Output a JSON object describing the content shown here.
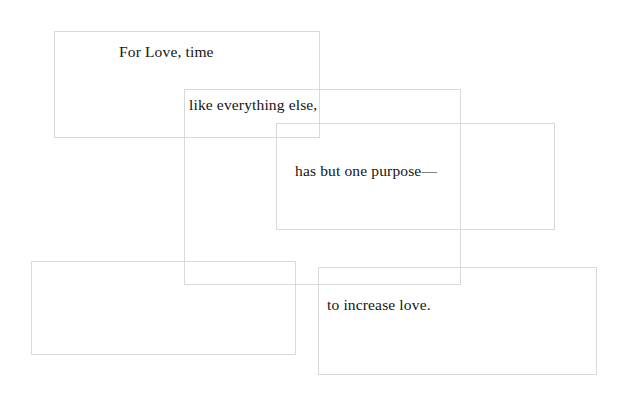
{
  "page": {
    "background_color": "#ffffff",
    "text_color": "#141414",
    "border_color": "#d9d9d9",
    "width": 627,
    "height": 405
  },
  "poem": {
    "lines": [
      "For Love, time",
      "like everything else,",
      "has but one purpose—",
      "to increase love."
    ],
    "full_text": "For Love, time like everything else, has but one purpose— to increase love."
  },
  "boxes": [
    {
      "id": "box-1",
      "label": "For Love, time",
      "x": 54,
      "y": 31,
      "width": 266,
      "height": 107,
      "text": "For Love, time",
      "text_x": 119,
      "text_y": 44,
      "empty": false
    },
    {
      "id": "box-2",
      "label": "like everything else,",
      "x": 184,
      "y": 89,
      "width": 277,
      "height": 196,
      "text": "like everything else,",
      "text_x": 189,
      "text_y": 97,
      "empty": false
    },
    {
      "id": "box-3",
      "label": "has but one purpose—",
      "x": 276,
      "y": 123,
      "width": 279,
      "height": 107,
      "text": "has but one purpose—",
      "text_x": 295,
      "text_y": 163,
      "empty": false
    },
    {
      "id": "box-4",
      "label": "empty box",
      "x": 31,
      "y": 261,
      "width": 265,
      "height": 94,
      "text": "",
      "text_x": 0,
      "text_y": 0,
      "empty": true
    },
    {
      "id": "box-5",
      "label": "to increase love.",
      "x": 318,
      "y": 267,
      "width": 279,
      "height": 108,
      "text": "to increase love.",
      "text_x": 327,
      "text_y": 297,
      "empty": false
    }
  ]
}
